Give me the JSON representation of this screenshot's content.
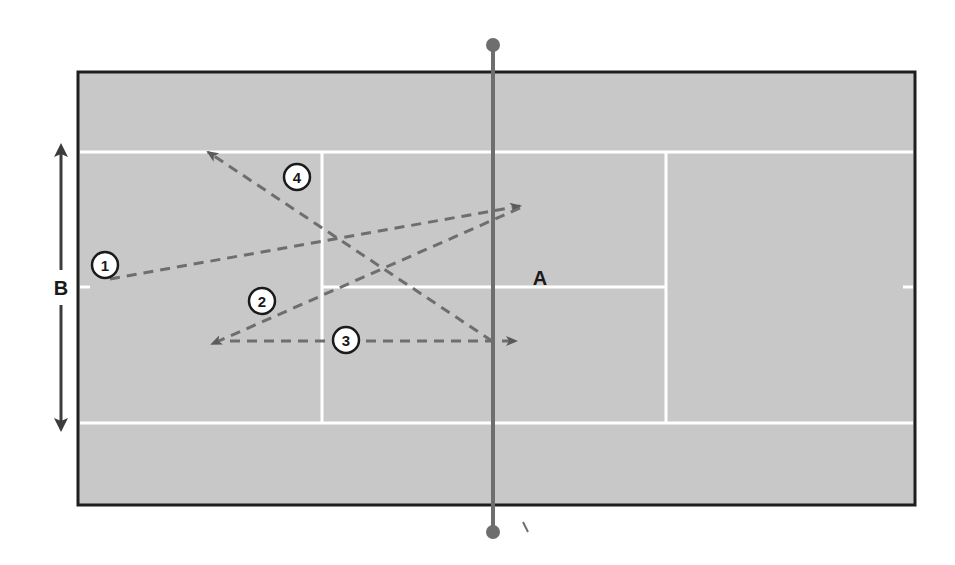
{
  "diagram": {
    "colors": {
      "background": "#ffffff",
      "court_surface": "#c8c8c8",
      "court_border": "#1e1e1e",
      "court_lines": "#ffffff",
      "net": "#6e6e6e",
      "shot_paths": "#6e6e6e",
      "arrow": "#3c3c3c"
    },
    "labels": {
      "net_position": "A",
      "width_dimension": "B"
    },
    "shots": [
      {
        "number": "1",
        "from": [
          120,
          280
        ],
        "to": [
          520,
          206
        ]
      },
      {
        "number": "2",
        "from": [
          520,
          206
        ],
        "to": [
          212,
          344
        ]
      },
      {
        "number": "3",
        "from": [
          212,
          341
        ],
        "to": [
          516,
          341
        ]
      },
      {
        "number": "4",
        "from": [
          492,
          341
        ],
        "to": [
          208,
          152
        ]
      }
    ]
  }
}
